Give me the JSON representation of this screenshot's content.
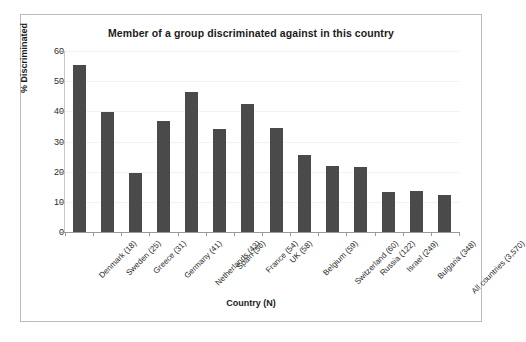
{
  "chart_data": {
    "type": "bar",
    "title": "Member of a group discriminated against in this country",
    "xlabel": "Country (N)",
    "ylabel": "% Discriminated",
    "ylim": [
      0,
      60
    ],
    "ytick_step": 10,
    "yticks": [
      0,
      10,
      20,
      30,
      40,
      50,
      60
    ],
    "grid": true,
    "legend": null,
    "bar_color": "#4a4a4a",
    "categories": [
      "Denmark (18)",
      "Sweden (25)",
      "Greece (31)",
      "Germany (41)",
      "Netherlands (43)",
      "Spain (50)",
      "France (54)",
      "UK (58)",
      "Belgium (59)",
      "Switzerland (60)",
      "Russia (122)",
      "Israel (249)",
      "Bulgaria (348)",
      "All countries (3,570)"
    ],
    "values": [
      55.5,
      39.9,
      19.5,
      36.7,
      46.5,
      34.1,
      42.5,
      34.6,
      25.4,
      21.8,
      21.4,
      13.3,
      13.6,
      12.4
    ]
  }
}
